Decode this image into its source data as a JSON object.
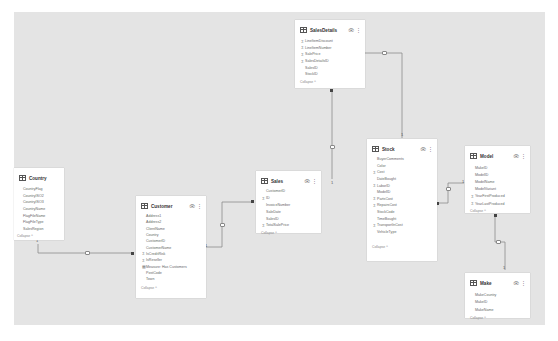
{
  "canvas": {
    "background": "#e4e4e4",
    "card_background": "#ffffff",
    "line_color": "#8a8a8a"
  },
  "tables": {
    "salesdetails": {
      "title": "SalesDetails",
      "collapse_label": "Collapse ^",
      "fields": [
        {
          "name": "LineItemDiscount",
          "icon": "sigma"
        },
        {
          "name": "LineItemNumber",
          "icon": "sigma"
        },
        {
          "name": "SalePrice",
          "icon": "sigma"
        },
        {
          "name": "SalesDetailsID",
          "icon": "sigma"
        },
        {
          "name": "SalesID",
          "icon": ""
        },
        {
          "name": "StockID",
          "icon": ""
        }
      ]
    },
    "country": {
      "title": "Country",
      "collapse_label": "Collapse ^",
      "fields": [
        {
          "name": "CountryFlag",
          "icon": ""
        },
        {
          "name": "CountryISO2",
          "icon": ""
        },
        {
          "name": "CountryISO3",
          "icon": ""
        },
        {
          "name": "CountryName",
          "icon": ""
        },
        {
          "name": "FlagFileName",
          "icon": ""
        },
        {
          "name": "FlagFileType",
          "icon": ""
        },
        {
          "name": "SalesRegion",
          "icon": ""
        }
      ]
    },
    "customer": {
      "title": "Customer",
      "collapse_label": "Collapse ^",
      "fields": [
        {
          "name": "Address1",
          "icon": ""
        },
        {
          "name": "Address2",
          "icon": ""
        },
        {
          "name": "ClientName",
          "icon": ""
        },
        {
          "name": "Country",
          "icon": ""
        },
        {
          "name": "CustomerID",
          "icon": ""
        },
        {
          "name": "CustomerName",
          "icon": ""
        },
        {
          "name": "IsCreditRisk",
          "icon": "sigma"
        },
        {
          "name": "IsReseller",
          "icon": "sigma"
        },
        {
          "name": "Measure: Has Customers",
          "icon": "table"
        },
        {
          "name": "PostCode",
          "icon": ""
        },
        {
          "name": "Town",
          "icon": ""
        }
      ]
    },
    "sales": {
      "title": "Sales",
      "collapse_label": "Collapse ^",
      "fields": [
        {
          "name": "CustomerID",
          "icon": ""
        },
        {
          "name": "ID",
          "icon": "sigma"
        },
        {
          "name": "InvoiceNumber",
          "icon": ""
        },
        {
          "name": "SaleDate",
          "icon": ""
        },
        {
          "name": "SalesID",
          "icon": ""
        },
        {
          "name": "TotalSalePrice",
          "icon": "sigma"
        }
      ]
    },
    "stock": {
      "title": "Stock",
      "collapse_label": "Collapse ^",
      "fields": [
        {
          "name": "BuyerComments",
          "icon": ""
        },
        {
          "name": "Color",
          "icon": ""
        },
        {
          "name": "Cost",
          "icon": "sigma"
        },
        {
          "name": "DateBought",
          "icon": ""
        },
        {
          "name": "LaborID",
          "icon": "sigma"
        },
        {
          "name": "ModelID",
          "icon": ""
        },
        {
          "name": "PartsCost",
          "icon": "sigma"
        },
        {
          "name": "RepairsCost",
          "icon": "sigma"
        },
        {
          "name": "StockCode",
          "icon": ""
        },
        {
          "name": "TimeBought",
          "icon": ""
        },
        {
          "name": "TransportInCost",
          "icon": "sigma"
        },
        {
          "name": "VehicleType",
          "icon": ""
        }
      ]
    },
    "model": {
      "title": "Model",
      "collapse_label": "Collapse ^",
      "fields": [
        {
          "name": "MakeID",
          "icon": ""
        },
        {
          "name": "ModelID",
          "icon": ""
        },
        {
          "name": "ModelName",
          "icon": ""
        },
        {
          "name": "ModelVariant",
          "icon": ""
        },
        {
          "name": "YearFirstProduced",
          "icon": "sigma"
        },
        {
          "name": "YearLastProduced",
          "icon": "sigma"
        }
      ]
    },
    "make": {
      "title": "Make",
      "collapse_label": "Collapse ^",
      "fields": [
        {
          "name": "MakeCountry",
          "icon": ""
        },
        {
          "name": "MakeID",
          "icon": ""
        },
        {
          "name": "MakeName",
          "icon": ""
        }
      ]
    }
  },
  "relationships": [
    {
      "from": "Country",
      "to": "Customer",
      "from_card": "1",
      "to_card": "*"
    },
    {
      "from": "Customer",
      "to": "Sales",
      "from_card": "1",
      "to_card": "*"
    },
    {
      "from": "Sales",
      "to": "SalesDetails",
      "from_card": "1",
      "to_card": "*"
    },
    {
      "from": "Stock",
      "to": "SalesDetails",
      "from_card": "1",
      "to_card": "*"
    },
    {
      "from": "Model",
      "to": "Stock",
      "from_card": "1",
      "to_card": "*"
    },
    {
      "from": "Make",
      "to": "Model",
      "from_card": "1",
      "to_card": "*"
    }
  ],
  "labels": {
    "one": "1",
    "many": "*"
  }
}
